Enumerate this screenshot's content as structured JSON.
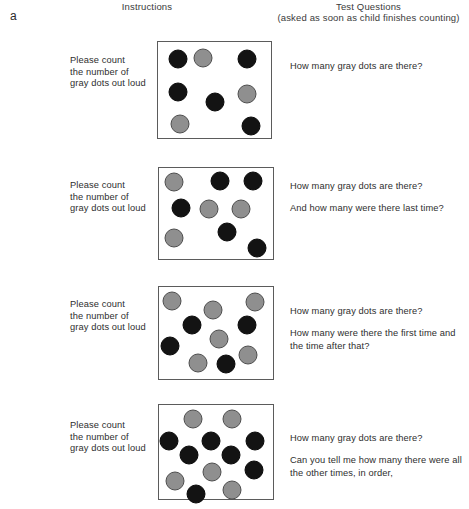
{
  "figure": {
    "panel_letter": "a",
    "headers": {
      "instructions": "Instructions",
      "questions_line1": "Test Questions",
      "questions_line2": "(asked as soon as child finishes counting)"
    },
    "colors": {
      "gray_dot": "#8f8f8f",
      "gray_dot_border": "#4e4e4e",
      "black_dot": "#131313",
      "box_border": "#5b5b5b",
      "text": "#2e2e2e",
      "background": "#ffffff"
    }
  },
  "rows": [
    {
      "id": "trial-1",
      "instruction_lines": [
        "Please count",
        "the number of",
        "gray dots out loud"
      ],
      "questions": [
        "How many gray dots are there?"
      ],
      "box": {
        "left": 157,
        "top": 41,
        "width": 115,
        "height": 98
      },
      "dot_counts": {
        "total": 8,
        "gray": 3,
        "black": 5
      },
      "dots": [
        {
          "color": "black",
          "cx": 20,
          "cy": 17,
          "r": 9.5
        },
        {
          "color": "gray",
          "cx": 45,
          "cy": 16,
          "r": 9.5
        },
        {
          "color": "black",
          "cx": 89,
          "cy": 17,
          "r": 9.5
        },
        {
          "color": "black",
          "cx": 20,
          "cy": 50,
          "r": 9.5
        },
        {
          "color": "gray",
          "cx": 89,
          "cy": 52,
          "r": 9.5
        },
        {
          "color": "black",
          "cx": 57,
          "cy": 60,
          "r": 9.5
        },
        {
          "color": "gray",
          "cx": 22,
          "cy": 82,
          "r": 9.5
        },
        {
          "color": "black",
          "cx": 93,
          "cy": 84,
          "r": 9.5
        }
      ]
    },
    {
      "id": "trial-2",
      "instruction_lines": [
        "Please count",
        "the number of",
        "gray dots out loud"
      ],
      "questions": [
        "How many gray dots are there?",
        "And how many were there last time?"
      ],
      "box": {
        "left": 158,
        "top": 167,
        "width": 116,
        "height": 93
      },
      "dot_counts": {
        "total": 9,
        "gray": 4,
        "black": 5
      },
      "dots": [
        {
          "color": "gray",
          "cx": 15,
          "cy": 14,
          "r": 9.5
        },
        {
          "color": "black",
          "cx": 61,
          "cy": 13,
          "r": 9.5
        },
        {
          "color": "black",
          "cx": 94,
          "cy": 13,
          "r": 9.5
        },
        {
          "color": "black",
          "cx": 22,
          "cy": 40,
          "r": 9.5
        },
        {
          "color": "gray",
          "cx": 50,
          "cy": 41,
          "r": 9.5
        },
        {
          "color": "gray",
          "cx": 82,
          "cy": 41,
          "r": 9.5
        },
        {
          "color": "gray",
          "cx": 15,
          "cy": 70,
          "r": 9.5
        },
        {
          "color": "black",
          "cx": 68,
          "cy": 64,
          "r": 9.5
        },
        {
          "color": "black",
          "cx": 98,
          "cy": 80,
          "r": 9.5
        }
      ]
    },
    {
      "id": "trial-3",
      "instruction_lines": [
        "Please count",
        "the number of",
        "gray dots out loud"
      ],
      "questions": [
        "How many gray dots are there?",
        "How many were there the first time and the time after that?"
      ],
      "box": {
        "left": 158,
        "top": 286,
        "width": 116,
        "height": 94
      },
      "dot_counts": {
        "total": 11,
        "gray": 6,
        "black": 5
      },
      "dots": [
        {
          "color": "gray",
          "cx": 13,
          "cy": 14,
          "r": 9.5
        },
        {
          "color": "gray",
          "cx": 54,
          "cy": 23,
          "r": 9.5
        },
        {
          "color": "gray",
          "cx": 96,
          "cy": 15,
          "r": 9.5
        },
        {
          "color": "black",
          "cx": 33,
          "cy": 38,
          "r": 9.5
        },
        {
          "color": "black",
          "cx": 88,
          "cy": 38,
          "r": 9.5
        },
        {
          "color": "gray",
          "cx": 60,
          "cy": 52,
          "r": 9.5
        },
        {
          "color": "black",
          "cx": 11,
          "cy": 59,
          "r": 9.5
        },
        {
          "color": "gray",
          "cx": 89,
          "cy": 68,
          "r": 9.5
        },
        {
          "color": "gray",
          "cx": 39,
          "cy": 76,
          "r": 9.5
        },
        {
          "color": "black",
          "cx": 67,
          "cy": 77,
          "r": 9.5
        }
      ]
    },
    {
      "id": "trial-4",
      "instruction_lines": [
        "Please count",
        "the number of",
        "gray dots out loud"
      ],
      "questions": [
        "How many gray dots are there?",
        "Can you tell me how many there were all the other times, in order,"
      ],
      "box": {
        "left": 158,
        "top": 404,
        "width": 116,
        "height": 96
      },
      "dot_counts": {
        "total": 13,
        "gray": 6,
        "black": 7
      },
      "dots": [
        {
          "color": "gray",
          "cx": 34,
          "cy": 14,
          "r": 9.5
        },
        {
          "color": "gray",
          "cx": 73,
          "cy": 14,
          "r": 9.5
        },
        {
          "color": "black",
          "cx": 10,
          "cy": 36,
          "r": 9.5
        },
        {
          "color": "black",
          "cx": 52,
          "cy": 36,
          "r": 9.5
        },
        {
          "color": "black",
          "cx": 96,
          "cy": 36,
          "r": 9.5
        },
        {
          "color": "black",
          "cx": 30,
          "cy": 50,
          "r": 9.5
        },
        {
          "color": "black",
          "cx": 72,
          "cy": 50,
          "r": 9.5
        },
        {
          "color": "gray",
          "cx": 53,
          "cy": 67,
          "r": 9.5
        },
        {
          "color": "black",
          "cx": 95,
          "cy": 65,
          "r": 9.5
        },
        {
          "color": "gray",
          "cx": 16,
          "cy": 76,
          "r": 9.5
        },
        {
          "color": "black",
          "cx": 37,
          "cy": 89,
          "r": 9.5
        },
        {
          "color": "gray",
          "cx": 73,
          "cy": 85,
          "r": 9.5
        }
      ]
    }
  ]
}
